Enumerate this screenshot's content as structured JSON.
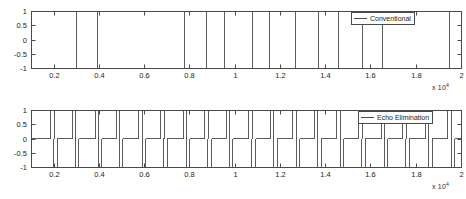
{
  "figure": {
    "background_color": "#ffffff",
    "line_color": "#4a4a4a",
    "axis_color": "#4a4a4a",
    "text_color": "#1c1c1c"
  },
  "subplots": [
    {
      "id": "top",
      "legend_label": "Conventional",
      "legend_position": "top-right",
      "x_exponent_label": "x 10",
      "x_exponent_power": "4"
    },
    {
      "id": "bottom",
      "legend_label": "Echo Elimination",
      "legend_position": "top-right",
      "x_exponent_label": "x 10",
      "x_exponent_power": "4"
    }
  ],
  "chart_data": [
    {
      "type": "line",
      "title": "",
      "xlabel": "",
      "ylabel": "",
      "xlim": [
        1000,
        20000
      ],
      "ylim": [
        -1,
        1
      ],
      "xticks": [
        2000,
        4000,
        6000,
        8000,
        10000,
        12000,
        14000,
        16000,
        18000,
        20000
      ],
      "xticklabels": [
        "0.2",
        "0.4",
        "0.6",
        "0.8",
        "1",
        "1.2",
        "1.4",
        "1.6",
        "1.8",
        "2"
      ],
      "x_axis_exponent": "x 10^4",
      "yticks": [
        -1,
        -0.5,
        0,
        0.5,
        1
      ],
      "yticklabels": [
        "-1",
        "-0.5",
        "0",
        "0.5",
        "1"
      ],
      "grid": false,
      "legend": [
        "Conventional"
      ],
      "legend_position": "upper right",
      "series": [
        {
          "name": "Conventional",
          "waveform": "square-bipolar",
          "description": "Bipolar NRZ square wave alternating between -1 and +1",
          "levels": [
            -1,
            1
          ],
          "transitions_x": [
            1000,
            3000,
            3950,
            7800,
            8750,
            9550,
            10800,
            11550,
            12700,
            13700,
            14600,
            15650,
            16550,
            19500,
            20000
          ],
          "segment_levels": [
            -1,
            1,
            -1,
            1,
            -1,
            1,
            -1,
            1,
            -1,
            1,
            -1,
            1,
            -1,
            1
          ]
        }
      ]
    },
    {
      "type": "line",
      "title": "",
      "xlabel": "",
      "ylabel": "",
      "xlim": [
        1000,
        20000
      ],
      "ylim": [
        -1,
        1
      ],
      "xticks": [
        2000,
        4000,
        6000,
        8000,
        10000,
        12000,
        14000,
        16000,
        18000,
        20000
      ],
      "xticklabels": [
        "0.2",
        "0.4",
        "0.6",
        "0.8",
        "1",
        "1.2",
        "1.4",
        "1.6",
        "1.8",
        "2"
      ],
      "x_axis_exponent": "x 10^4",
      "yticks": [
        -1,
        -0.5,
        0,
        0.5,
        1
      ],
      "yticklabels": [
        "-1",
        "-0.5",
        "0",
        "0.5",
        "1"
      ],
      "grid": false,
      "legend": [
        "Echo Elimination"
      ],
      "legend_position": "upper right",
      "series": [
        {
          "name": "Echo Elimination",
          "waveform": "impulse-bipolar",
          "description": "Narrow bipolar impulses on a zero baseline marking signal transitions",
          "baseline": 0,
          "impulses": [
            {
              "x": 1950,
              "amplitude": 1
            },
            {
              "x": 2080,
              "amplitude": -1
            },
            {
              "x": 2900,
              "amplitude": 1
            },
            {
              "x": 3030,
              "amplitude": -1
            },
            {
              "x": 3920,
              "amplitude": 1
            },
            {
              "x": 4050,
              "amplitude": -1
            },
            {
              "x": 4850,
              "amplitude": 1
            },
            {
              "x": 4980,
              "amplitude": -1
            },
            {
              "x": 5850,
              "amplitude": 1
            },
            {
              "x": 5990,
              "amplitude": -1
            },
            {
              "x": 6800,
              "amplitude": 1
            },
            {
              "x": 6930,
              "amplitude": -1
            },
            {
              "x": 7800,
              "amplitude": 1
            },
            {
              "x": 7930,
              "amplitude": -1
            },
            {
              "x": 8760,
              "amplitude": 1
            },
            {
              "x": 8900,
              "amplitude": -1
            },
            {
              "x": 9700,
              "amplitude": 1
            },
            {
              "x": 9830,
              "amplitude": -1
            },
            {
              "x": 10700,
              "amplitude": 1
            },
            {
              "x": 10840,
              "amplitude": -1
            },
            {
              "x": 11650,
              "amplitude": 1
            },
            {
              "x": 11790,
              "amplitude": -1
            },
            {
              "x": 12650,
              "amplitude": 1
            },
            {
              "x": 12790,
              "amplitude": -1
            },
            {
              "x": 13600,
              "amplitude": 1
            },
            {
              "x": 13740,
              "amplitude": -1
            },
            {
              "x": 14600,
              "amplitude": 1
            },
            {
              "x": 14740,
              "amplitude": -1
            },
            {
              "x": 15550,
              "amplitude": 1
            },
            {
              "x": 15690,
              "amplitude": -1
            },
            {
              "x": 16550,
              "amplitude": 1
            },
            {
              "x": 16690,
              "amplitude": -1
            },
            {
              "x": 17500,
              "amplitude": 1
            },
            {
              "x": 17640,
              "amplitude": -1
            },
            {
              "x": 18500,
              "amplitude": 1
            },
            {
              "x": 18640,
              "amplitude": -1
            },
            {
              "x": 19500,
              "amplitude": 1
            },
            {
              "x": 19640,
              "amplitude": -1
            }
          ]
        }
      ]
    }
  ]
}
